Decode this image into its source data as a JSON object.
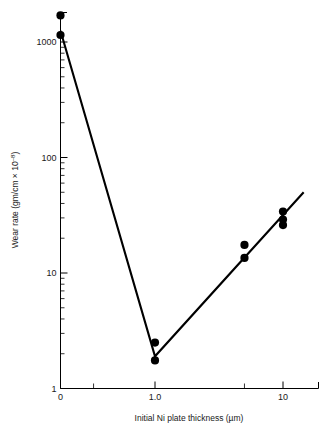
{
  "figure": {
    "title": "",
    "background": "#ffffff",
    "foreground": "#000000"
  },
  "axes": {
    "x": {
      "title": "Initial Ni plate thickness (µm)",
      "scale": "linear-then-log",
      "tick_labels": [
        "0",
        "1.0",
        "10"
      ],
      "tick_values": [
        0,
        1.0,
        10
      ]
    },
    "y": {
      "title": "Wear rate (gm/cm × 10",
      "title_exponent": "–8",
      "title_suffix": ")",
      "scale": "log",
      "tick_labels": [
        "1",
        "10",
        "100",
        "1000"
      ],
      "tick_values": [
        1,
        10,
        100,
        1000
      ],
      "range": [
        1,
        2000
      ]
    }
  },
  "chart_data": {
    "type": "scatter",
    "title": "",
    "xlabel": "Initial Ni plate thickness (µm)",
    "ylabel": "Wear rate (gm/cm × 10⁻⁸)",
    "xscale": "linear-then-log",
    "yscale": "log",
    "xlim": [
      0,
      17
    ],
    "ylim": [
      1,
      2000
    ],
    "xticks": [
      0,
      1.0,
      10
    ],
    "xticklabels": [
      "0",
      "1.0",
      "10"
    ],
    "yticks": [
      1,
      10,
      100,
      1000
    ],
    "yticklabels": [
      "1",
      "10",
      "100",
      "1000"
    ],
    "grid": false,
    "legend": false,
    "series": [
      {
        "name": "Wear rate data",
        "marker": "filled-circle",
        "color": "#000000",
        "points": [
          {
            "x": 0.0,
            "y": 1700
          },
          {
            "x": 0.0,
            "y": 1150
          },
          {
            "x": 1.0,
            "y": 2.5
          },
          {
            "x": 1.0,
            "y": 1.75
          },
          {
            "x": 5.0,
            "y": 17.5
          },
          {
            "x": 5.0,
            "y": 13.5
          },
          {
            "x": 10.0,
            "y": 34
          },
          {
            "x": 10.0,
            "y": 29
          },
          {
            "x": 10.0,
            "y": 26
          }
        ]
      },
      {
        "name": "Fitted V trend",
        "type": "line",
        "color": "#000000",
        "points": [
          {
            "x": 0.0,
            "y": 1250
          },
          {
            "x": 1.0,
            "y": 1.9
          },
          {
            "x": 14.5,
            "y": 50
          }
        ]
      }
    ]
  }
}
